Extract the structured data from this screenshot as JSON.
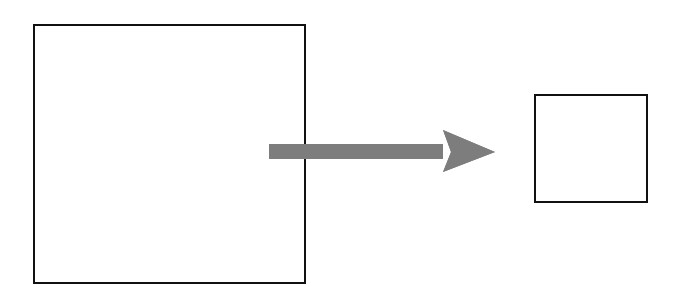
{
  "page": {
    "width": 678,
    "height": 292,
    "background_color": "#ffffff"
  },
  "diagram": {
    "type": "transformation-diagram",
    "shapes": [
      {
        "name": "large-square",
        "kind": "rectangle",
        "label": "",
        "x": 33,
        "y": 24,
        "width": 273,
        "height": 260,
        "stroke_color": "#111111",
        "stroke_width": 2.5,
        "fill_color": "none"
      },
      {
        "name": "small-square",
        "kind": "rectangle",
        "label": "",
        "x": 534,
        "y": 94,
        "width": 114,
        "height": 109,
        "stroke_color": "#111111",
        "stroke_width": 2.5,
        "fill_color": "none"
      }
    ],
    "connector": {
      "name": "right-arrow",
      "kind": "block-arrow",
      "direction": "right",
      "label": "",
      "tip_x": 495,
      "tip_y": 152,
      "tail_x": 269,
      "shaft_top_y": 144,
      "shaft_bottom_y": 159,
      "head_barb_top_y": 130,
      "head_barb_bottom_y": 172,
      "head_back_x": 443,
      "head_notch_x": 451,
      "fill_color": "#7d7d7d"
    }
  },
  "colors": {
    "stroke": "#111111",
    "arrow_gray": "#7d7d7d",
    "background": "#ffffff"
  }
}
